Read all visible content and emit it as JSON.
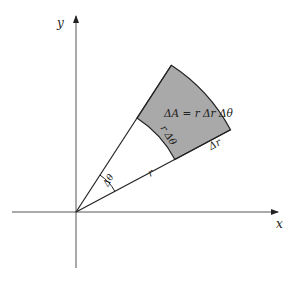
{
  "diagram": {
    "axes": {
      "x_label": "x",
      "y_label": "y"
    },
    "labels": {
      "area": "ΔA = r Δr Δθ",
      "arc_length": "r Δθ",
      "radial_width": "Δr",
      "radius": "r",
      "angle": "Δθ"
    },
    "colors": {
      "shaded_region": "#a9a9a9",
      "lines": "#222222",
      "background": "#ffffff"
    },
    "geometry": {
      "origin": [
        76,
        212
      ],
      "inner_radius": 112,
      "outer_radius": 175,
      "theta_low_deg": 28,
      "theta_high_deg": 57
    }
  }
}
